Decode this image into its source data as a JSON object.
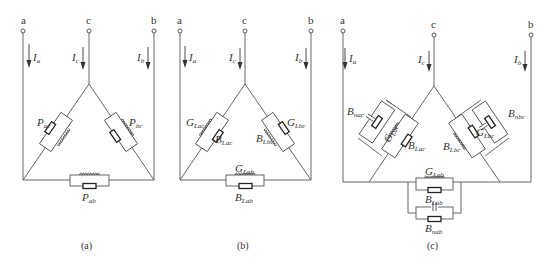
{
  "diagrams": [
    {
      "id": "a",
      "caption": "(a)",
      "terminals": [
        "a",
        "c",
        "b"
      ],
      "currents": [
        {
          "symbol": "I",
          "sub": "a"
        },
        {
          "symbol": "I",
          "sub": "c"
        },
        {
          "symbol": "I",
          "sub": "b"
        }
      ],
      "branches": {
        "ac": {
          "label": "P",
          "sub": "ac"
        },
        "bc": {
          "label": "P",
          "sub": "bc"
        },
        "ab": {
          "label": "P",
          "sub": "ab"
        }
      }
    },
    {
      "id": "b",
      "caption": "(b)",
      "terminals": [
        "a",
        "c",
        "b"
      ],
      "currents": [
        {
          "symbol": "I",
          "sub": "a"
        },
        {
          "symbol": "I",
          "sub": "c"
        },
        {
          "symbol": "I",
          "sub": "b"
        }
      ],
      "branches": {
        "ac_g": {
          "label": "G",
          "sub": "Lac"
        },
        "ac_b": {
          "label": "B",
          "sub": "Lac"
        },
        "bc_g": {
          "label": "G",
          "sub": "Lbc"
        },
        "bc_b": {
          "label": "B",
          "sub": "Lbc"
        },
        "ab_g": {
          "label": "G",
          "sub": "Lab"
        },
        "ab_b": {
          "label": "B",
          "sub": "Lab"
        }
      }
    },
    {
      "id": "c",
      "caption": "(c)",
      "terminals": [
        "a",
        "c",
        "b"
      ],
      "currents": [
        {
          "symbol": "I",
          "sub": "a"
        },
        {
          "symbol": "I",
          "sub": "c"
        },
        {
          "symbol": "I",
          "sub": "b"
        }
      ],
      "branches": {
        "ac_bn": {
          "label": "B",
          "sub": "nac"
        },
        "ac_g": {
          "label": "G",
          "sub": "Lac"
        },
        "ac_b": {
          "label": "B",
          "sub": "Lac"
        },
        "bc_bn": {
          "label": "B",
          "sub": "nbc"
        },
        "bc_g": {
          "label": "G",
          "sub": "Lbc"
        },
        "bc_b": {
          "label": "B",
          "sub": "Lbc"
        },
        "ab_g": {
          "label": "G",
          "sub": "Lab"
        },
        "ab_b": {
          "label": "B",
          "sub": "Lab"
        },
        "ab_bn": {
          "label": "B",
          "sub": "nab"
        }
      }
    }
  ]
}
